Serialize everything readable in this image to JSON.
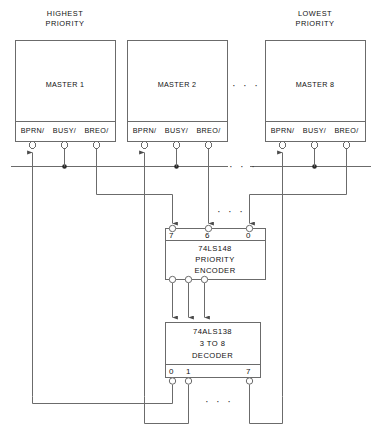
{
  "diagram": {
    "colors": {
      "line": "#6b6b6b",
      "text": "#111111",
      "background": "#ffffff"
    },
    "headers": [
      {
        "id": "highest",
        "line1": "HIGHEST",
        "line2": "PRIORITY"
      },
      {
        "id": "lowest",
        "line1": "LOWEST",
        "line2": "PRIORITY"
      }
    ],
    "masters": [
      {
        "id": "master-1",
        "label": "MASTER 1",
        "pins": [
          {
            "name": "bprn",
            "label": "BPRN/"
          },
          {
            "name": "busy",
            "label": "BUSY/"
          },
          {
            "name": "breq",
            "label": "BREO/"
          }
        ]
      },
      {
        "id": "master-2",
        "label": "MASTER 2",
        "pins": [
          {
            "name": "bprn",
            "label": "BPRN/"
          },
          {
            "name": "busy",
            "label": "BUSY/"
          },
          {
            "name": "breq",
            "label": "BREO/"
          }
        ]
      },
      {
        "id": "master-8",
        "label": "MASTER 8",
        "pins": [
          {
            "name": "bprn",
            "label": "BPRN/"
          },
          {
            "name": "busy",
            "label": "BUSY/"
          },
          {
            "name": "breq",
            "label": "BREO/"
          }
        ]
      }
    ],
    "encoder": {
      "id": "priority-encoder",
      "part": "74LS148",
      "line2": "PRIORITY",
      "line3": "ENCODER",
      "input_pins": [
        "7",
        "6",
        "0"
      ]
    },
    "decoder": {
      "id": "decoder",
      "part": "74ALS138",
      "line2": "3 TO 8",
      "line3": "DECODER",
      "output_pins": [
        "0",
        "1",
        "7"
      ]
    },
    "ellipses": [
      {
        "id": "masters-gap",
        "text": "· · ·"
      },
      {
        "id": "bus-gap",
        "text": "· · ·"
      },
      {
        "id": "encoder-inputs-gap",
        "text": "· · ·"
      },
      {
        "id": "decoder-outputs-gap",
        "text": "· · ·"
      }
    ]
  }
}
